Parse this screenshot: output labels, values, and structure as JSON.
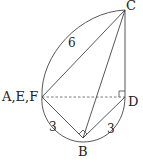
{
  "diagram": {
    "points": [
      {
        "id": "C",
        "label": "C",
        "x": 125,
        "y": 10
      },
      {
        "id": "AEF",
        "label": "A,E,F",
        "x": 42,
        "y": 97
      },
      {
        "id": "D",
        "label": "D",
        "x": 125,
        "y": 97
      },
      {
        "id": "B",
        "label": "B",
        "x": 83,
        "y": 138
      }
    ],
    "lengths": {
      "arc_AC": "6",
      "arc_AB": "3",
      "arc_BD": "3"
    },
    "right_angles": [
      "D",
      "B"
    ],
    "dashed_segments": [
      [
        "AEF",
        "D"
      ]
    ]
  }
}
